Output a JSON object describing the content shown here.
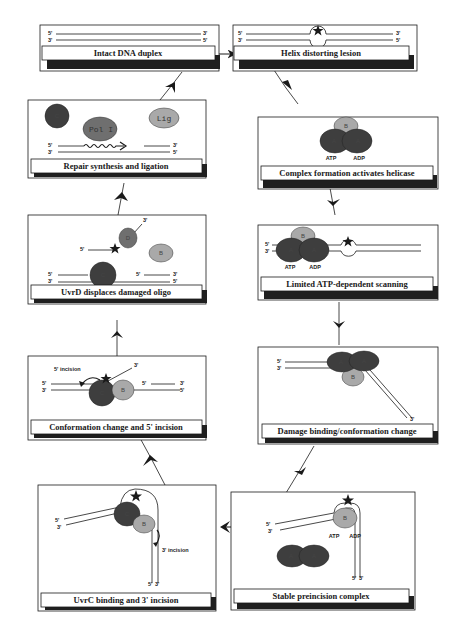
{
  "figure": {
    "colors": {
      "dark_protein": "#3e3e3e",
      "light_protein": "#a9a9a9",
      "mid_protein": "#6f6f6f",
      "line": "#1a1a1a",
      "shadow": "#1f1f1f"
    },
    "panels": [
      {
        "id": "p1",
        "caption": "Intact DNA duplex",
        "labels": {
          "top_left": "5'",
          "bottom_left": "3'",
          "top_right": "3'",
          "bottom_right": "5'"
        }
      },
      {
        "id": "p2",
        "caption": "Helix distorting lesion",
        "labels": {
          "top_left": "5'",
          "bottom_left": "3'",
          "top_right": "3'",
          "bottom_right": "5'"
        }
      },
      {
        "id": "p3",
        "caption": "Complex formation activates helicase",
        "proteins": [
          "B",
          "A",
          "A"
        ],
        "labels": {
          "atp": "ATP",
          "adp": "ADP"
        }
      },
      {
        "id": "p4",
        "caption": "Limited ATP-dependent scanning",
        "proteins": [
          "B",
          "A",
          "A"
        ],
        "labels": {
          "top_left": "5'",
          "bottom_left": "3'",
          "top_right": "3'",
          "bottom_right": "5'",
          "atp": "ATP",
          "adp": "ADP"
        }
      },
      {
        "id": "p5",
        "caption": "Damage binding/conformation change",
        "proteins": [
          "A",
          "A",
          "B"
        ],
        "labels": {
          "top_left": "5'",
          "bottom_left": "3'",
          "strand_end": "3'"
        }
      },
      {
        "id": "p6",
        "caption": "Stable preincision complex",
        "proteins": [
          "B",
          "A",
          "A"
        ],
        "labels": {
          "top_left": "5'",
          "bottom_left": "3'",
          "atp": "ATP",
          "adp": "ADP",
          "end_5": "5'",
          "end_3": "3'"
        }
      },
      {
        "id": "p7",
        "caption": "UvrC binding and 3' incision",
        "proteins": [
          "C",
          "B"
        ],
        "labels": {
          "top_left": "5'",
          "bottom_left": "3'",
          "incision": "3' incision",
          "end_5": "5'",
          "end_3": "3'"
        }
      },
      {
        "id": "p8",
        "caption": "Conformation change and 5' incision",
        "proteins": [
          "C",
          "B"
        ],
        "labels": {
          "incision": "5' incision",
          "oligo_end": "3'",
          "top_left": "5'",
          "bottom_left": "3'",
          "top_right_5": "5'",
          "top_right_3": "3'",
          "bottom_right": "5'"
        }
      },
      {
        "id": "p9",
        "caption": "UvrD displaces damaged oligo",
        "proteins": [
          "D",
          "B",
          "C"
        ],
        "labels": {
          "oligo_3": "3'",
          "oligo_5": "5'",
          "top_left": "5'",
          "bottom_left": "3'",
          "top_right_5": "5'",
          "top_right_3": "3'",
          "bottom_right": "5'"
        }
      },
      {
        "id": "p10",
        "caption": "Repair synthesis and ligation",
        "proteins": [
          "C",
          "Pol I",
          "Lig"
        ],
        "labels": {
          "top_left": "5'",
          "bottom_left": "3'",
          "top_right": "3'",
          "bottom_right": "5'"
        }
      }
    ]
  }
}
